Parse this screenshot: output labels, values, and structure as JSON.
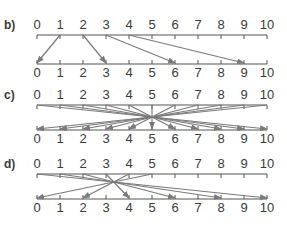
{
  "panels": [
    {
      "label": "b)",
      "description": "mapping x -> 3x - 3",
      "axis_ticks": [
        "0",
        "1",
        "2",
        "3",
        "4",
        "5",
        "6",
        "7",
        "8",
        "9",
        "10"
      ],
      "mappings": [
        [
          1,
          0
        ],
        [
          2,
          3
        ],
        [
          3,
          6
        ],
        [
          4,
          9
        ]
      ]
    },
    {
      "label": "c)",
      "description": "mapping x -> 10 - x",
      "axis_ticks": [
        "0",
        "1",
        "2",
        "3",
        "4",
        "5",
        "6",
        "7",
        "8",
        "9",
        "10"
      ],
      "mappings": [
        [
          0,
          10
        ],
        [
          1,
          9
        ],
        [
          2,
          8
        ],
        [
          3,
          7
        ],
        [
          4,
          6
        ],
        [
          5,
          5
        ],
        [
          6,
          4
        ],
        [
          7,
          3
        ],
        [
          8,
          2
        ],
        [
          9,
          1
        ],
        [
          10,
          0
        ]
      ]
    },
    {
      "label": "d)",
      "description": "mapping x -> 10 - 2x",
      "axis_ticks": [
        "0",
        "1",
        "2",
        "3",
        "4",
        "5",
        "6",
        "7",
        "8",
        "9",
        "10"
      ],
      "mappings": [
        [
          0,
          10
        ],
        [
          1,
          8
        ],
        [
          2,
          6
        ],
        [
          3,
          4
        ],
        [
          4,
          2
        ],
        [
          5,
          0
        ]
      ]
    }
  ],
  "colors": {
    "axis": "#555555",
    "arrow": "#7a7a7a",
    "text": "#3a3a3a"
  }
}
